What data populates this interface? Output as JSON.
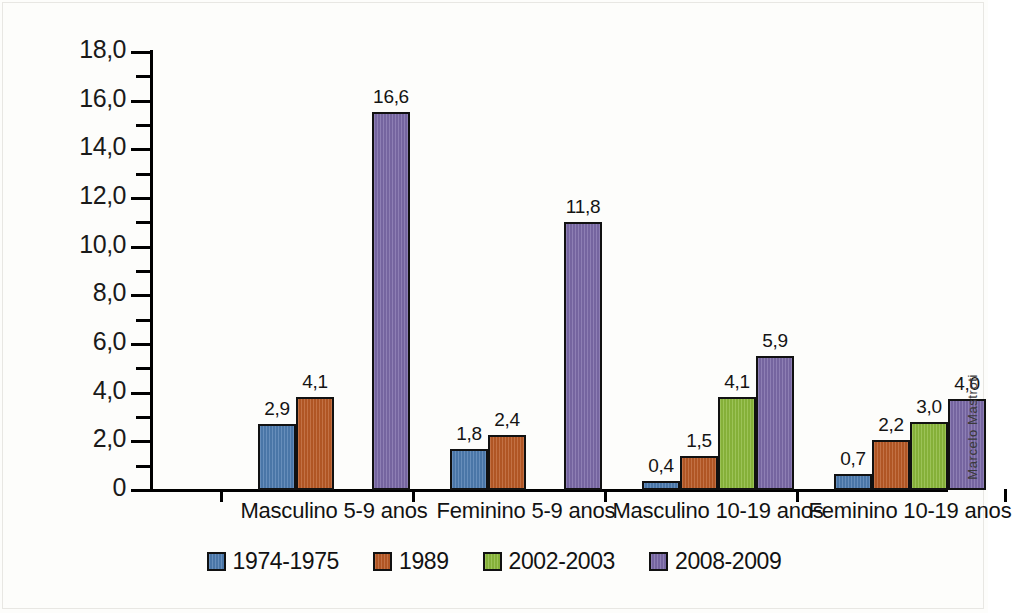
{
  "chart_data": {
    "type": "bar",
    "title": "",
    "subtitle": "",
    "xlabel": "",
    "ylabel": "",
    "ylim": [
      0,
      18
    ],
    "ytick_labels": [
      "0",
      "2,0",
      "4,0",
      "6,0",
      "8,0",
      "10,0",
      "12,0",
      "14,0",
      "16,0",
      "18,0"
    ],
    "ytick_values": [
      0,
      2,
      4,
      6,
      8,
      10,
      12,
      14,
      16,
      18
    ],
    "yminor_values": [
      1,
      3,
      5,
      7,
      9,
      11,
      13,
      15,
      17
    ],
    "grid": false,
    "legend_position": "bottom",
    "decimal_separator": ",",
    "categories": [
      "Masculino 5-9 anos",
      "Feminino 5-9 anos",
      "Masculino 10-19 anos",
      "Feminino 10-19 anos"
    ],
    "series": [
      {
        "name": "1974-1975",
        "color": "#4e7cb0",
        "values": [
          2.9,
          1.8,
          0.4,
          0.7
        ],
        "labels": [
          "2,9",
          "1,8",
          "0,4",
          "0,7"
        ]
      },
      {
        "name": "1989",
        "color": "#b95a26",
        "values": [
          4.1,
          2.4,
          1.5,
          2.2
        ],
        "labels": [
          "4,1",
          "2,4",
          "1,5",
          "2,2"
        ]
      },
      {
        "name": "2002-2003",
        "color": "#8cb93c",
        "values": [
          null,
          null,
          4.1,
          3.0
        ],
        "labels": [
          "",
          "",
          "4,1",
          "3,0"
        ]
      },
      {
        "name": "2008-2009",
        "color": "#7b6aa8",
        "values": [
          16.6,
          11.8,
          5.9,
          4.0
        ],
        "labels": [
          "16,6",
          "11,8",
          "5,9",
          "4,0"
        ]
      }
    ],
    "annotations": [
      "Marcelo Mastroti"
    ]
  },
  "credit": {
    "text": "Marcelo Mastroti"
  },
  "colors": {
    "series_1974_1975": "#4e7cb0",
    "series_1989": "#b95a26",
    "series_2002_2003": "#8cb93c",
    "series_2008_2009": "#7b6aa8",
    "axis": "#000000",
    "text": "#121212",
    "background": "#fdfdfb"
  }
}
